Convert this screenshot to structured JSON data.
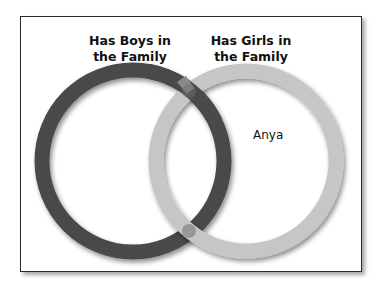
{
  "diagram": {
    "type": "venn",
    "sets": [
      {
        "label_line1": "Has Boys in",
        "label_line2": "the Family",
        "color": "#4a4a4a"
      },
      {
        "label_line1": "Has Girls in",
        "label_line2": "the Family",
        "color": "#c6c6c6"
      }
    ],
    "items": [
      {
        "name": "Anya",
        "region": "Has Girls in the Family only"
      }
    ]
  }
}
